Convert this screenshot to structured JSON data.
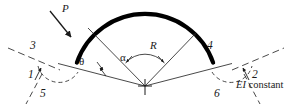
{
  "figure": {
    "kind": "engineering-diagram",
    "background_color": "#ffffff",
    "ink_color": "#1a1a1a",
    "arch_color": "#000000"
  },
  "labels": {
    "load": "P",
    "radius": "R",
    "angle_theta": "θ",
    "angle_alpha": "α",
    "node_1": "1",
    "node_2": "2",
    "node_3": "3",
    "node_4": "4",
    "node_5": "5",
    "node_6": "6"
  },
  "note": {
    "italic_part": "EI",
    "plain_part": " constant"
  },
  "geometry": {
    "center_x": 145,
    "center_y": 86,
    "radius": 72,
    "arch_start_deg": 161,
    "arch_end_deg": 19,
    "arch_stroke_width": 4.2,
    "thin_stroke_width": 0.8
  }
}
